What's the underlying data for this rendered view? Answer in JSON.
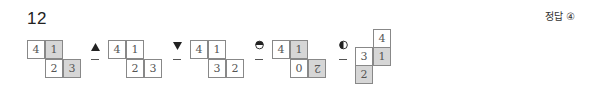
{
  "question": {
    "number": "12"
  },
  "answer": {
    "label": "정답 ④"
  },
  "steps": [
    {
      "cells": [
        {
          "v": "4",
          "grey": false
        },
        {
          "v": "1",
          "grey": true
        },
        {
          "v": "2",
          "grey": false
        },
        {
          "v": "3",
          "grey": true
        }
      ]
    },
    {
      "op": "triangle-up",
      "cells": [
        {
          "v": "4",
          "grey": false
        },
        {
          "v": "1",
          "grey": false
        },
        {
          "v": "2",
          "grey": false
        },
        {
          "v": "3",
          "grey": false
        }
      ]
    },
    {
      "op": "triangle-down",
      "cells": [
        {
          "v": "4",
          "grey": false
        },
        {
          "v": "1",
          "grey": false
        },
        {
          "v": "3",
          "grey": false
        },
        {
          "v": "2",
          "grey": false
        }
      ]
    },
    {
      "op": "half-circle-top-filled",
      "cells": [
        {
          "v": "4",
          "grey": false
        },
        {
          "v": "1",
          "grey": true
        },
        {
          "v": "0",
          "grey": false
        },
        {
          "v": "2",
          "grey": true,
          "flipped": true
        }
      ]
    },
    {
      "op": "half-circle-left-filled",
      "cells": [
        {
          "v": "4",
          "grey": false
        },
        {
          "v": "3",
          "grey": false
        },
        {
          "v": "1",
          "grey": true
        },
        {
          "v": "2",
          "grey": true
        }
      ]
    }
  ],
  "colors": {
    "cell_border": "#888888",
    "cell_grey": "#d6d6d6",
    "text": "#555555"
  }
}
